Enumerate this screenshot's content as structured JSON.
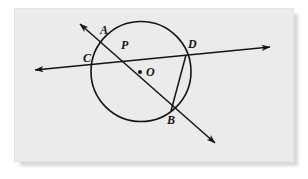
{
  "figure": {
    "background_color": "#ebebeb",
    "page_color": "#ffffff",
    "ink_color": "#141414",
    "circle": {
      "center_x": 141,
      "center_y": 71.5,
      "radius": 50,
      "stroke_width": 1.6
    },
    "center_dot": {
      "x": 140,
      "y": 72,
      "radius": 2.0
    },
    "lines": [
      {
        "name": "secant-line-AB",
        "from_x": 80,
        "from_y": 24,
        "to_x": 215,
        "to_y": 143,
        "arrow_start": true,
        "arrow_end": true
      },
      {
        "name": "secant-line-CD",
        "from_x": 35,
        "from_y": 70,
        "to_x": 270,
        "to_y": 47,
        "arrow_start": true,
        "arrow_end": true
      },
      {
        "name": "chord-DB",
        "from_x": 186,
        "from_y": 55,
        "to_x": 171,
        "to_y": 111,
        "arrow_start": false,
        "arrow_end": false
      }
    ],
    "labels": [
      {
        "name": "point-label-A",
        "text": "A",
        "x": 100,
        "y": 24
      },
      {
        "name": "point-label-C",
        "text": "C",
        "x": 83,
        "y": 52
      },
      {
        "name": "point-label-P",
        "text": "P",
        "x": 121,
        "y": 39
      },
      {
        "name": "point-label-D",
        "text": "D",
        "x": 188,
        "y": 38
      },
      {
        "name": "point-label-O",
        "text": "O",
        "x": 146,
        "y": 66
      },
      {
        "name": "point-label-B",
        "text": "B",
        "x": 167,
        "y": 114
      }
    ]
  }
}
